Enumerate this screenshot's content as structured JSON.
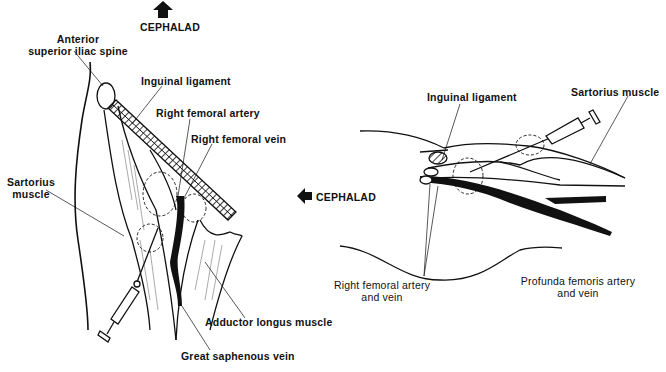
{
  "figure": {
    "left_panel": {
      "orientation": {
        "label": "CEPHALAD",
        "arrow": "up-arrow-icon"
      },
      "labels": {
        "asis_line1": "Anterior",
        "asis_line2": "superior iliac spine",
        "inguinal_ligament": "Inguinal ligament",
        "right_femoral_artery": "Right femoral artery",
        "right_femoral_vein": "Right femoral vein",
        "sartorius_line1": "Sartorius",
        "sartorius_line2": "muscle",
        "adductor_longus": "Adductor longus muscle",
        "great_saphenous": "Great saphenous vein"
      }
    },
    "right_panel": {
      "orientation": {
        "label": "CEPHALAD",
        "arrow": "left-arrow-icon"
      },
      "labels": {
        "inguinal_ligament": "Inguinal ligament",
        "sartorius": "Sartorius muscle",
        "femoral_av_line1": "Right femoral artery",
        "femoral_av_line2": "and vein",
        "profunda_line1": "Profunda femoris artery",
        "profunda_line2": "and vein"
      }
    }
  }
}
